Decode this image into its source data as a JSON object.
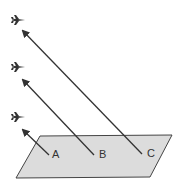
{
  "diagram": {
    "plane": {
      "fill": "#dcdcdc",
      "stroke": "#444444"
    },
    "points": [
      {
        "label": "A",
        "x": 51,
        "y": 155,
        "aircraft_y": 118,
        "arrow_tip": [
          21,
          128
        ]
      },
      {
        "label": "B",
        "x": 96,
        "y": 155,
        "aircraft_y": 67,
        "arrow_tip": [
          21,
          78
        ]
      },
      {
        "label": "C",
        "x": 144,
        "y": 154,
        "aircraft_y": 20,
        "arrow_tip": [
          21,
          29
        ]
      }
    ],
    "aircraft_icon": "jet-icon"
  }
}
